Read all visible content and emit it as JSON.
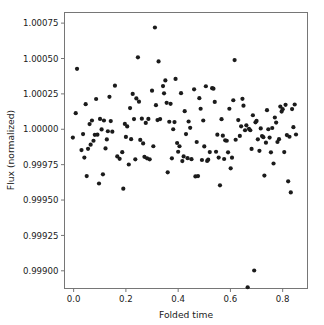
{
  "figure": {
    "background_color": "#ffffff",
    "axis_color": "#767676",
    "marker_color": "#1b1b1b"
  },
  "chart_data": {
    "type": "scatter",
    "title": "",
    "xlabel": "Folded time",
    "ylabel": "Flux (normalized)",
    "xlim": [
      -0.035,
      0.895
    ],
    "ylim": [
      0.998875,
      1.000825
    ],
    "grid": false,
    "legend": null,
    "marker": "circle",
    "marker_size": 2.1,
    "marker_color": "#1b1b1b",
    "xticks": [
      0.0,
      0.2,
      0.4,
      0.6,
      0.8
    ],
    "xticklabels": [
      "0.0",
      "0.2",
      "0.4",
      "0.6",
      "0.8"
    ],
    "yticks": [
      0.999,
      0.99925,
      0.9995,
      0.99975,
      1.0,
      1.00025,
      1.0005,
      1.00075
    ],
    "yticklabels": [
      "0.99900",
      "0.99925",
      "0.99950",
      "0.99975",
      "1.00000",
      "1.00025",
      "1.00050",
      "1.00075"
    ],
    "points": [
      [
        -0.003,
        0.999941
      ],
      [
        0.008,
        1.000114
      ],
      [
        0.013,
        1.000427
      ],
      [
        0.03,
        0.999853
      ],
      [
        0.036,
        0.999966
      ],
      [
        0.041,
        0.9998
      ],
      [
        0.046,
        1.000177
      ],
      [
        0.05,
        0.999669
      ],
      [
        0.055,
        0.999862
      ],
      [
        0.061,
        1.000037
      ],
      [
        0.065,
        0.999891
      ],
      [
        0.07,
        1.000062
      ],
      [
        0.076,
        0.999919
      ],
      [
        0.081,
        0.999961
      ],
      [
        0.086,
        1.000214
      ],
      [
        0.091,
        0.999962
      ],
      [
        0.097,
        0.999617
      ],
      [
        0.101,
        1.000073
      ],
      [
        0.107,
        0.999999
      ],
      [
        0.112,
        0.999682
      ],
      [
        0.116,
        1.000062
      ],
      [
        0.122,
        0.999865
      ],
      [
        0.127,
        0.999928
      ],
      [
        0.131,
        0.999986
      ],
      [
        0.137,
        1.000229
      ],
      [
        0.142,
        1.000058
      ],
      [
        0.148,
        0.999983
      ],
      [
        0.158,
        1.000308
      ],
      [
        0.167,
        0.999808
      ],
      [
        0.176,
        0.999791
      ],
      [
        0.186,
        0.999838
      ],
      [
        0.19,
        0.99958
      ],
      [
        0.196,
        1.000038
      ],
      [
        0.2,
        0.999946
      ],
      [
        0.205,
        1.00002
      ],
      [
        0.211,
        0.999751
      ],
      [
        0.216,
        1.00015
      ],
      [
        0.22,
        0.99993
      ],
      [
        0.226,
        1.00025
      ],
      [
        0.231,
        1.000072
      ],
      [
        0.236,
        0.999788
      ],
      [
        0.24,
        1.000218
      ],
      [
        0.246,
        1.000508
      ],
      [
        0.25,
        1.000195
      ],
      [
        0.255,
        0.999925
      ],
      [
        0.261,
        1.000075
      ],
      [
        0.266,
        0.9999
      ],
      [
        0.271,
        0.999805
      ],
      [
        0.276,
        1.000045
      ],
      [
        0.281,
        0.999795
      ],
      [
        0.286,
        1.000073
      ],
      [
        0.291,
        0.999788
      ],
      [
        0.3,
        1.000273
      ],
      [
        0.305,
        0.99988
      ],
      [
        0.311,
        1.000719
      ],
      [
        0.315,
        1.00017
      ],
      [
        0.321,
        1.000065
      ],
      [
        0.325,
        1.000479
      ],
      [
        0.331,
        1.000072
      ],
      [
        0.342,
        1.000305
      ],
      [
        0.346,
        1.000254
      ],
      [
        0.351,
        1.000345
      ],
      [
        0.356,
        1.000187
      ],
      [
        0.36,
        0.999696
      ],
      [
        0.366,
        1.000053
      ],
      [
        0.371,
        1.00018
      ],
      [
        0.376,
        0.999795
      ],
      [
        0.381,
        1.0
      ],
      [
        0.386,
        1.000051
      ],
      [
        0.39,
        1.000356
      ],
      [
        0.396,
        0.999903
      ],
      [
        0.4,
        0.999841
      ],
      [
        0.405,
        0.99988
      ],
      [
        0.411,
        1.000255
      ],
      [
        0.416,
        0.999775
      ],
      [
        0.421,
        0.999808
      ],
      [
        0.425,
        1.000128
      ],
      [
        0.43,
        0.999966
      ],
      [
        0.436,
        0.999796
      ],
      [
        0.44,
        1.000055
      ],
      [
        0.446,
        1.00001
      ],
      [
        0.451,
        0.999789
      ],
      [
        0.461,
        1.000282
      ],
      [
        0.466,
        0.999667
      ],
      [
        0.471,
        0.99991
      ],
      [
        0.476,
        0.999669
      ],
      [
        0.481,
        1.00022
      ],
      [
        0.486,
        1.000145
      ],
      [
        0.491,
        0.999783
      ],
      [
        0.496,
        1.000062
      ],
      [
        0.5,
        0.999879
      ],
      [
        0.506,
        1.000304
      ],
      [
        0.511,
        0.999776
      ],
      [
        0.515,
        0.999785
      ],
      [
        0.521,
        0.999839
      ],
      [
        0.53,
        1.00029
      ],
      [
        0.535,
        1.000287
      ],
      [
        0.54,
        1.000193
      ],
      [
        0.545,
        0.999841
      ],
      [
        0.55,
        0.999962
      ],
      [
        0.555,
        0.9998
      ],
      [
        0.56,
        0.999604
      ],
      [
        0.566,
        1.000071
      ],
      [
        0.571,
        0.999955
      ],
      [
        0.576,
        0.99979
      ],
      [
        0.58,
        0.999922
      ],
      [
        0.586,
        0.999919
      ],
      [
        0.591,
        0.999837
      ],
      [
        0.596,
        1.000145
      ],
      [
        0.601,
        0.999724
      ],
      [
        0.606,
        0.999799
      ],
      [
        0.611,
        1.000205
      ],
      [
        0.616,
        1.000489
      ],
      [
        0.62,
        0.999926
      ],
      [
        0.63,
        1.000065
      ],
      [
        0.636,
        0.999953
      ],
      [
        0.641,
        1.000021
      ],
      [
        0.646,
        1.000215
      ],
      [
        0.65,
        1.000167
      ],
      [
        0.656,
        0.999993
      ],
      [
        0.661,
        1.000028
      ],
      [
        0.666,
        0.998884
      ],
      [
        0.671,
        1.000003
      ],
      [
        0.676,
        0.999993
      ],
      [
        0.681,
        0.999861
      ],
      [
        0.686,
        1.000099
      ],
      [
        0.691,
        0.999002
      ],
      [
        0.696,
        1.000049
      ],
      [
        0.7,
        1.000059
      ],
      [
        0.705,
        0.999929
      ],
      [
        0.711,
        0.999848
      ],
      [
        0.716,
        1.000006
      ],
      [
        0.721,
        0.999952
      ],
      [
        0.726,
        0.999944
      ],
      [
        0.73,
        0.999673
      ],
      [
        0.736,
        0.999905
      ],
      [
        0.74,
        1.000135
      ],
      [
        0.745,
        1.0
      ],
      [
        0.75,
        0.999941
      ],
      [
        0.755,
        0.999837
      ],
      [
        0.76,
        1.000009
      ],
      [
        0.765,
        0.999758
      ],
      [
        0.77,
        1.000083
      ],
      [
        0.775,
        1.000047
      ],
      [
        0.78,
        0.99991
      ],
      [
        0.786,
        0.99993
      ],
      [
        0.791,
        1.00016
      ],
      [
        0.796,
        1.000125
      ],
      [
        0.8,
        1.000142
      ],
      [
        0.806,
        0.999839
      ],
      [
        0.811,
        1.000173
      ],
      [
        0.816,
        0.999959
      ],
      [
        0.821,
        0.999632
      ],
      [
        0.826,
        0.999947
      ],
      [
        0.831,
        0.999554
      ],
      [
        0.836,
        1.000143
      ],
      [
        0.841,
        1.000015
      ],
      [
        0.846,
        1.000175
      ],
      [
        0.851,
        0.999963
      ]
    ]
  }
}
